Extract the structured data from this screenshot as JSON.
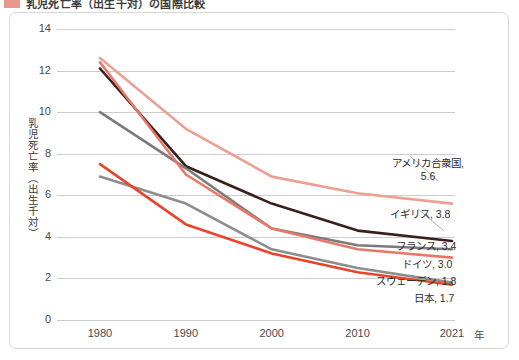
{
  "header": {
    "title": "乳児死亡率（出生千対）の国際比較",
    "marker_color": "#e8998c"
  },
  "chart_data": {
    "type": "line",
    "title": "乳児死亡率（出生千対）の国際比較",
    "xlabel": "年",
    "ylabel": "乳児死亡率（出生千対）",
    "x": [
      1980,
      1990,
      2000,
      2010,
      2021
    ],
    "xtick_labels": [
      "1980",
      "1990",
      "2000",
      "2010",
      "2021"
    ],
    "x_unit_label": "年",
    "ylim": [
      0,
      14
    ],
    "yticks": [
      0,
      2,
      4,
      6,
      8,
      10,
      12,
      14
    ],
    "ytick_labels": [
      "0",
      "2",
      "4",
      "6",
      "8",
      "10",
      "12",
      "14"
    ],
    "grid": true,
    "legend_position": "right-inline-annotations",
    "series": [
      {
        "name": "アメリカ合衆国",
        "color": "#eda091",
        "values": [
          12.6,
          9.2,
          6.9,
          6.1,
          5.6
        ],
        "end_value": 5.6,
        "label": "アメリカ合衆国,",
        "label_value": "5.6"
      },
      {
        "name": "イギリス",
        "color": "#3a1f1c",
        "values": [
          12.1,
          7.4,
          5.6,
          4.3,
          3.8
        ],
        "end_value": 3.8,
        "label": "イギリス,  3.8"
      },
      {
        "name": "フランス",
        "color": "#7b7b7b",
        "values": [
          10.0,
          7.3,
          4.4,
          3.6,
          3.4
        ],
        "end_value": 3.4,
        "label": "フランス,  3.4"
      },
      {
        "name": "ドイツ",
        "color": "#e8786a",
        "values": [
          12.4,
          7.0,
          4.4,
          3.4,
          3.0
        ],
        "end_value": 3.0,
        "label": "ドイツ,  3.0"
      },
      {
        "name": "スウェーデン",
        "color": "#8d8d8d",
        "values": [
          6.9,
          5.6,
          3.4,
          2.5,
          1.8
        ],
        "end_value": 1.8,
        "label": "スウェーデン,  1.8"
      },
      {
        "name": "日本",
        "color": "#e8442a",
        "values": [
          7.5,
          4.6,
          3.2,
          2.3,
          1.7
        ],
        "end_value": 1.7,
        "label": "日本,  1.7"
      }
    ],
    "annotations": [
      {
        "text": "アメリカ合衆国,",
        "value": "5.6"
      },
      {
        "text": "イギリス,  3.8"
      },
      {
        "text": "フランス,  3.4"
      },
      {
        "text": "ドイツ,  3.0"
      },
      {
        "text": "スウェーデン,  1.8"
      },
      {
        "text": "日本,  1.7"
      }
    ]
  }
}
